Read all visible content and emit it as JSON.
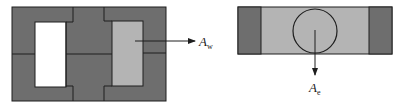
{
  "diagram": {
    "type": "transformer-core-cross-section",
    "colors": {
      "core": "#6e6e6e",
      "winding": "#b4b4b4",
      "window": "#ffffff",
      "outline": "#1e1e1e"
    },
    "left_view": {
      "description": "Front view of shell-type core with window and winding",
      "label": {
        "main": "A",
        "subscript": "w"
      }
    },
    "right_view": {
      "description": "Side/top view showing circular center leg cross-section",
      "label": {
        "main": "A",
        "subscript": "e"
      }
    }
  }
}
